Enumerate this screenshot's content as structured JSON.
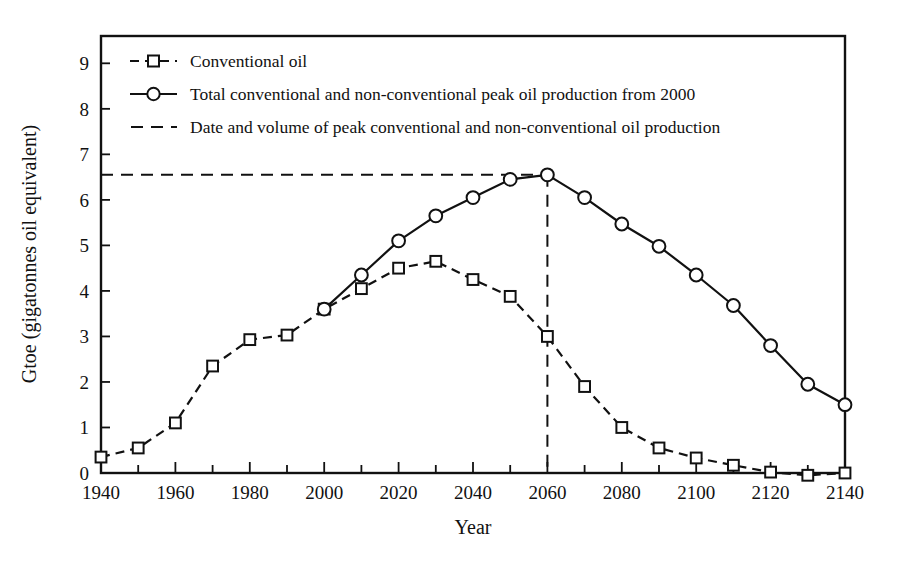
{
  "chart_data": {
    "type": "line",
    "title": "",
    "xlabel": "Year",
    "ylabel": "Gtoe (gigatonnes oil equivalent)",
    "xlim": [
      1940,
      2140
    ],
    "ylim": [
      0,
      9.6
    ],
    "grid": false,
    "legend_position": "top-left",
    "x_ticks_major": [
      1940,
      1960,
      1980,
      2000,
      2020,
      2040,
      2060,
      2080,
      2100,
      2120,
      2140
    ],
    "x_tick_labels": [
      "1940",
      "1960",
      "1980",
      "2000",
      "2020",
      "2040",
      "2060",
      "2080",
      "2100",
      "2120",
      "2140"
    ],
    "x_ticks_minor": [
      1950,
      1970,
      1990,
      2010,
      2030,
      2050,
      2070,
      2090,
      2110,
      2130
    ],
    "y_ticks": [
      0,
      1,
      2,
      3,
      4,
      5,
      6,
      7,
      8,
      9
    ],
    "y_tick_labels": [
      "0",
      "1",
      "2",
      "3",
      "4",
      "5",
      "6",
      "7",
      "8",
      "9"
    ],
    "x": [
      1940,
      1950,
      1960,
      1970,
      1980,
      1990,
      2000,
      2010,
      2020,
      2030,
      2040,
      2050,
      2060,
      2070,
      2080,
      2090,
      2100,
      2110,
      2120,
      2130,
      2140
    ],
    "series": [
      {
        "name": "Conventional oil",
        "marker": "square",
        "line_style": "dashed",
        "values": [
          0.35,
          0.55,
          1.1,
          2.35,
          2.93,
          3.03,
          3.6,
          4.05,
          4.5,
          4.65,
          4.25,
          3.88,
          3.0,
          1.9,
          1.0,
          0.55,
          0.33,
          0.17,
          0.02,
          -0.05,
          0.0
        ]
      },
      {
        "name": "Total conventional and non-conventional peak oil production from 2000",
        "marker": "circle",
        "line_style": "solid",
        "x": [
          2000,
          2010,
          2020,
          2030,
          2040,
          2050,
          2060,
          2070,
          2080,
          2090,
          2100,
          2110,
          2120,
          2130,
          2140
        ],
        "values": [
          3.6,
          4.35,
          5.1,
          5.65,
          6.05,
          6.45,
          6.55,
          6.05,
          5.47,
          4.98,
          4.35,
          3.68,
          2.8,
          1.95,
          1.5
        ]
      }
    ],
    "annotations": [
      {
        "name": "peak-guide",
        "label": "Date and volume of peak conventional and non-conventional oil production",
        "x": 2060,
        "y": 6.55,
        "line_style": "dashed"
      }
    ],
    "legend": [
      {
        "label": "Conventional oil",
        "marker": "square",
        "line_style": "dashed"
      },
      {
        "label": "Total conventional and non-conventional peak oil production from 2000",
        "marker": "circle",
        "line_style": "solid"
      },
      {
        "label": "Date and volume of peak conventional and non-conventional oil production",
        "marker": "none",
        "line_style": "dashed"
      }
    ]
  }
}
